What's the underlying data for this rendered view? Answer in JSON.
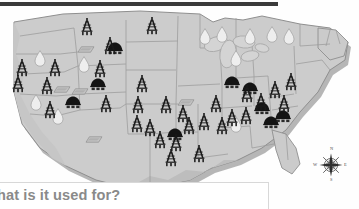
{
  "page": {
    "background_color": "#fefefe"
  },
  "top_rule": {
    "name": "horizontal-rule",
    "color": "#3a3a3a"
  },
  "callout": {
    "question_text": "hat is it used for?",
    "full_question": "What is it used for?",
    "text_color": "#8a8a8a",
    "box_color": "#ffffff"
  },
  "map": {
    "name": "united-states-resource-map",
    "land_fill": "#cccccc",
    "land_stroke": "#9a9a9a",
    "shadow_fill": "#aaaaaa",
    "lakes_fill": "#d6d6d6",
    "legend_note": "Symbols plotted on map indicate energy resource deposits"
  },
  "symbols": {
    "oil_derrick": {
      "icon": "oil-derrick-icon",
      "color": "#1a1a1a",
      "count": 31
    },
    "coal_mound": {
      "icon": "coal-mound-icon",
      "color": "#151515",
      "count": 9
    },
    "coal_seam": {
      "icon": "coal-seam-slab-icon",
      "color": "#bdbdbd",
      "count": 5
    },
    "gas_drop": {
      "icon": "gas-droplet-icon",
      "color": "#e8e8e8",
      "count": 11
    }
  },
  "compass": {
    "name": "compass-rose",
    "north": "N",
    "east": "E",
    "south": "S",
    "west": "W"
  },
  "markers": {
    "derricks": [
      [
        87,
        21
      ],
      [
        152,
        20
      ],
      [
        110,
        40
      ],
      [
        100,
        63
      ],
      [
        22,
        62
      ],
      [
        55,
        62
      ],
      [
        18,
        78
      ],
      [
        47,
        80
      ],
      [
        142,
        78
      ],
      [
        50,
        104
      ],
      [
        106,
        98
      ],
      [
        138,
        99
      ],
      [
        166,
        99
      ],
      [
        183,
        108
      ],
      [
        137,
        118
      ],
      [
        150,
        122
      ],
      [
        189,
        120
      ],
      [
        204,
        116
      ],
      [
        160,
        134
      ],
      [
        176,
        137
      ],
      [
        222,
        120
      ],
      [
        232,
        112
      ],
      [
        246,
        110
      ],
      [
        261,
        96
      ],
      [
        275,
        84
      ],
      [
        291,
        76
      ],
      [
        284,
        98
      ],
      [
        247,
        88
      ],
      [
        216,
        98
      ],
      [
        171,
        152
      ],
      [
        199,
        148
      ]
    ],
    "coal_mounds": [
      [
        115,
        42
      ],
      [
        98,
        78
      ],
      [
        73,
        96
      ],
      [
        175,
        128
      ],
      [
        250,
        82
      ],
      [
        262,
        102
      ],
      [
        271,
        116
      ],
      [
        283,
        110
      ],
      [
        232,
        76
      ]
    ],
    "coal_seams": [
      [
        86,
        42
      ],
      [
        62,
        82
      ],
      [
        80,
        84
      ],
      [
        94,
        132
      ],
      [
        186,
        95
      ]
    ],
    "drops": [
      [
        40,
        52
      ],
      [
        84,
        58
      ],
      [
        36,
        96
      ],
      [
        58,
        110
      ],
      [
        236,
        52
      ],
      [
        205,
        30
      ],
      [
        222,
        28
      ],
      [
        250,
        30
      ],
      [
        272,
        28
      ],
      [
        289,
        30
      ],
      [
        236,
        118
      ]
    ]
  }
}
